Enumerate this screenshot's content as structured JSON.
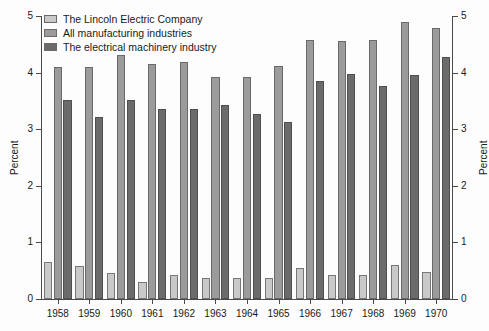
{
  "chart_data": {
    "type": "bar",
    "title": "",
    "subtitle": "",
    "xlabel": "",
    "ylabel": "Percent",
    "ylabel_right": "Percent",
    "ylim": [
      0,
      5
    ],
    "yticks": [
      0,
      1,
      2,
      3,
      4,
      5
    ],
    "ytick_labels": [
      "0",
      "1",
      "2",
      "3",
      "4",
      "5"
    ],
    "grid": false,
    "legend_position": "top-left",
    "categories": [
      "1958",
      "1959",
      "1960",
      "1961",
      "1962",
      "1963",
      "1964",
      "1965",
      "1966",
      "1967",
      "1968",
      "1969",
      "1970"
    ],
    "series": [
      {
        "name": "The Lincoln Electric Company",
        "color": "#c9c9c9",
        "values": [
          0.65,
          0.58,
          0.46,
          0.3,
          0.42,
          0.38,
          0.38,
          0.38,
          0.55,
          0.43,
          0.43,
          0.6,
          0.47
        ]
      },
      {
        "name": "All manufacturing industries",
        "color": "#9b9b9b",
        "values": [
          4.1,
          4.1,
          4.32,
          4.15,
          4.18,
          3.92,
          3.92,
          4.12,
          4.57,
          4.55,
          4.57,
          4.9,
          4.78
        ]
      },
      {
        "name": "The electrical machinery industry",
        "color": "#6b6b6b",
        "values": [
          3.52,
          3.22,
          3.52,
          3.35,
          3.35,
          3.42,
          3.27,
          3.12,
          3.85,
          3.98,
          3.77,
          3.95,
          4.27
        ]
      }
    ]
  },
  "axes": {
    "left": {
      "title": "Percent",
      "tick_labels": [
        "0",
        "1",
        "2",
        "3",
        "4",
        "5"
      ]
    },
    "right": {
      "title": "Percent",
      "tick_labels": [
        "0",
        "1",
        "2",
        "3",
        "4",
        "5"
      ]
    },
    "bottom": {
      "tick_labels": [
        "1958",
        "1959",
        "1960",
        "1961",
        "1962",
        "1963",
        "1964",
        "1965",
        "1966",
        "1967",
        "1968",
        "1969",
        "1970"
      ]
    }
  },
  "legend": {
    "items": [
      {
        "label": "The Lincoln Electric Company",
        "color": "#c9c9c9"
      },
      {
        "label": "All manufacturing industries",
        "color": "#9b9b9b"
      },
      {
        "label": "The electrical machinery industry",
        "color": "#6b6b6b"
      }
    ]
  }
}
